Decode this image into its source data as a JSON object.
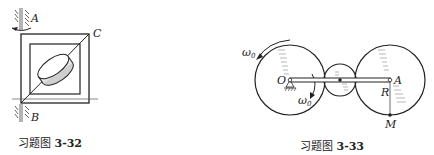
{
  "figures": [
    {
      "id": "3-32",
      "caption_prefix": "习题图",
      "caption_number": "3-32",
      "labels": {
        "A": "A",
        "B": "B",
        "C": "C"
      }
    },
    {
      "id": "3-33",
      "caption_prefix": "习题图",
      "caption_number": "3-33",
      "labels": {
        "omega_outer": "ω",
        "omega_outer_sub": "0",
        "omega_inner": "ω",
        "omega_inner_sub": "0",
        "O": "O",
        "A": "A",
        "R": "R",
        "M": "M"
      }
    }
  ],
  "colors": {
    "ink": "#222222",
    "hatch": "#777777",
    "background": "#ffffff"
  }
}
